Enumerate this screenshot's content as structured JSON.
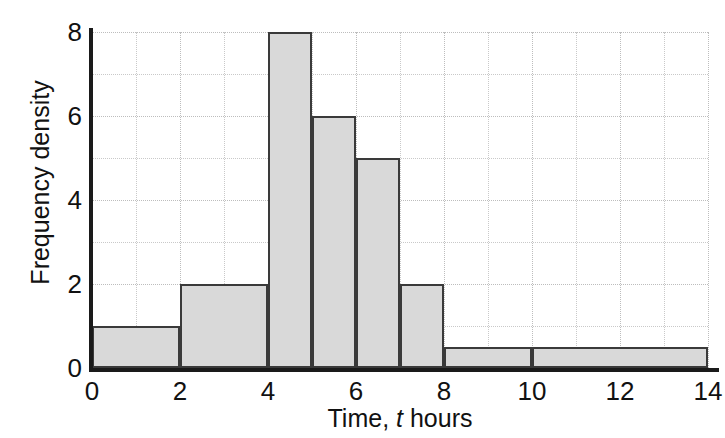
{
  "chart_data": {
    "type": "bar",
    "chart_subtype": "histogram",
    "title": "",
    "xlabel_parts": {
      "prefix": "Time,",
      "variable": "t",
      "suffix": "hours"
    },
    "xlabel": "Time, t hours",
    "ylabel": "Frequency density",
    "xlim": [
      0,
      14
    ],
    "ylim": [
      0,
      8
    ],
    "x_ticks": [
      "0",
      "2",
      "4",
      "6",
      "8",
      "10",
      "12",
      "14"
    ],
    "x_tick_values": [
      0,
      2,
      4,
      6,
      8,
      10,
      12,
      14
    ],
    "y_ticks": [
      "0",
      "2",
      "4",
      "6",
      "8"
    ],
    "y_tick_values": [
      0,
      2,
      4,
      6,
      8
    ],
    "grid": true,
    "grid_x_step": 1,
    "grid_y_step": 1,
    "legend": "none",
    "bar_fill_color": "#d9d9d9",
    "bar_edge_color": "#3a3a3a",
    "axis_color": "#1a1a1a",
    "grid_color": "#c9c9c9",
    "bins": [
      {
        "label": "0-2",
        "start": 0,
        "end": 2,
        "frequency_density": 1,
        "frequency": 2
      },
      {
        "label": "2-4",
        "start": 2,
        "end": 4,
        "frequency_density": 2,
        "frequency": 4
      },
      {
        "label": "4-5",
        "start": 4,
        "end": 5,
        "frequency_density": 8,
        "frequency": 8
      },
      {
        "label": "5-6",
        "start": 5,
        "end": 6,
        "frequency_density": 6,
        "frequency": 6
      },
      {
        "label": "6-7",
        "start": 6,
        "end": 7,
        "frequency_density": 5,
        "frequency": 5
      },
      {
        "label": "7-8",
        "start": 7,
        "end": 8,
        "frequency_density": 2,
        "frequency": 2
      },
      {
        "label": "8-10",
        "start": 8,
        "end": 10,
        "frequency_density": 0.5,
        "frequency": 1
      },
      {
        "label": "10-14",
        "start": 10,
        "end": 14,
        "frequency_density": 0.5,
        "frequency": 2
      }
    ],
    "categories": [
      "0-2",
      "2-4",
      "4-5",
      "5-6",
      "6-7",
      "7-8",
      "8-10",
      "10-14"
    ],
    "values": [
      1,
      2,
      8,
      6,
      5,
      2,
      0.5,
      0.5
    ]
  }
}
